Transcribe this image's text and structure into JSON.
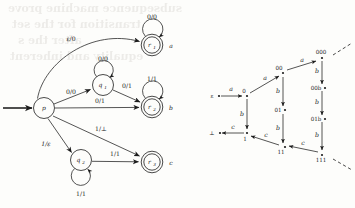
{
  "page": {
    "width": 355,
    "height": 208,
    "background": "#fdfdfb",
    "ink_color": "#1c1c1c"
  },
  "ghost_text": {
    "note": "faint bleed-through from reverse side of scanned page",
    "lines": [
      "subsequence machine prove",
      "transition for the set",
      "after the s",
      "equality and inherent"
    ]
  },
  "figures": [
    {
      "id": "transducer",
      "name": "finite-state-transducer",
      "caption": "",
      "start_state": "p",
      "states": [
        {
          "id": "p",
          "label": "p",
          "sub": "",
          "accepting": false,
          "output": ""
        },
        {
          "id": "q1",
          "label": "q",
          "sub": "1",
          "accepting": false,
          "output": ""
        },
        {
          "id": "q2",
          "label": "q",
          "sub": "2",
          "accepting": false,
          "output": ""
        },
        {
          "id": "r1",
          "label": "r",
          "sub": "1",
          "accepting": true,
          "output": "a"
        },
        {
          "id": "r2",
          "label": "r",
          "sub": "2",
          "accepting": true,
          "output": "b"
        },
        {
          "id": "r3",
          "label": "r",
          "sub": "3",
          "accepting": true,
          "output": "c"
        }
      ],
      "transitions": [
        {
          "from": "p",
          "to": "r1",
          "label": "ε/0",
          "kind": "curve"
        },
        {
          "from": "p",
          "to": "q1",
          "label": "0/0",
          "kind": "line"
        },
        {
          "from": "p",
          "to": "r2",
          "label": "0/1",
          "kind": "line"
        },
        {
          "from": "p",
          "to": "r3",
          "label": "1/⊥",
          "kind": "line"
        },
        {
          "from": "p",
          "to": "q2",
          "label": "1/ε",
          "kind": "line"
        },
        {
          "from": "q1",
          "to": "r2",
          "label": "0/1",
          "kind": "line"
        },
        {
          "from": "q2",
          "to": "r3",
          "label": "1/1",
          "kind": "line"
        },
        {
          "from": "r1",
          "to": "r1",
          "label": "0/0",
          "kind": "loop"
        },
        {
          "from": "q1",
          "to": "q1",
          "label": "0/0",
          "kind": "loop"
        },
        {
          "from": "r2",
          "to": "r2",
          "label": "1/1",
          "kind": "loop"
        },
        {
          "from": "q2",
          "to": "q2",
          "label": "1/1",
          "kind": "loop"
        }
      ]
    },
    {
      "id": "lattice",
      "name": "string-lattice-diagram",
      "nodes": [
        {
          "id": "eps",
          "label": "ε",
          "x": 215,
          "y": 96
        },
        {
          "id": "bot",
          "label": "⊥",
          "x": 215,
          "y": 133
        },
        {
          "id": "n0",
          "label": "0",
          "x": 247,
          "y": 96
        },
        {
          "id": "n1",
          "label": "1",
          "x": 247,
          "y": 133
        },
        {
          "id": "n00",
          "label": "00",
          "x": 283,
          "y": 73
        },
        {
          "id": "n01",
          "label": "01",
          "x": 283,
          "y": 110
        },
        {
          "id": "n11",
          "label": "11",
          "x": 283,
          "y": 147
        },
        {
          "id": "n000",
          "label": "000",
          "x": 320,
          "y": 58
        },
        {
          "id": "n00b",
          "label": "00b",
          "x": 320,
          "y": 88
        },
        {
          "id": "n01b",
          "label": "01b",
          "x": 320,
          "y": 119
        },
        {
          "id": "n111",
          "label": "111",
          "x": 320,
          "y": 155
        }
      ],
      "edges": [
        {
          "from": "eps",
          "to": "n0",
          "label": "a"
        },
        {
          "from": "n1",
          "to": "bot",
          "label": "c"
        },
        {
          "from": "n0",
          "to": "n1",
          "label": "b"
        },
        {
          "from": "n0",
          "to": "n00",
          "label": "a"
        },
        {
          "from": "n00",
          "to": "n000",
          "label": "a"
        },
        {
          "from": "n00",
          "to": "n01",
          "label": "b"
        },
        {
          "from": "n01",
          "to": "n11",
          "label": "b"
        },
        {
          "from": "n11",
          "to": "n1",
          "label": "c"
        },
        {
          "from": "n000",
          "to": "n00b",
          "label": "b"
        },
        {
          "from": "n00b",
          "to": "n01b",
          "label": "b"
        },
        {
          "from": "n01b",
          "to": "n111",
          "label": "b"
        },
        {
          "from": "n111",
          "to": "n11",
          "label": "c"
        }
      ],
      "continuation_dashes": [
        {
          "at": "n000",
          "direction": "up-right"
        },
        {
          "at": "n111",
          "direction": "down-right"
        }
      ]
    }
  ]
}
